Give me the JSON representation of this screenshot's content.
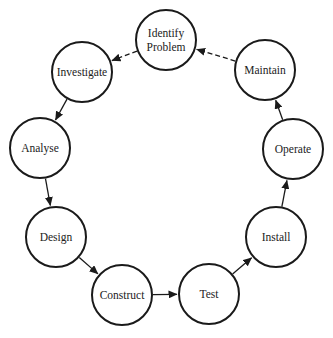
{
  "diagram": {
    "type": "cycle",
    "nodes": [
      {
        "id": "identify",
        "label_lines": [
          "Identify",
          "Problem"
        ],
        "cx": 166,
        "cy": 40,
        "r": 30
      },
      {
        "id": "investigate",
        "label_lines": [
          "Investigate"
        ],
        "cx": 82,
        "cy": 72,
        "r": 30
      },
      {
        "id": "analyse",
        "label_lines": [
          "Analyse"
        ],
        "cx": 40,
        "cy": 148,
        "r": 30
      },
      {
        "id": "design",
        "label_lines": [
          "Design"
        ],
        "cx": 56,
        "cy": 237,
        "r": 30
      },
      {
        "id": "construct",
        "label_lines": [
          "Construct"
        ],
        "cx": 122,
        "cy": 295,
        "r": 30
      },
      {
        "id": "test",
        "label_lines": [
          "Test"
        ],
        "cx": 209,
        "cy": 294,
        "r": 30
      },
      {
        "id": "install",
        "label_lines": [
          "Install"
        ],
        "cx": 276,
        "cy": 237,
        "r": 30
      },
      {
        "id": "operate",
        "label_lines": [
          "Operate"
        ],
        "cx": 293,
        "cy": 149,
        "r": 30
      },
      {
        "id": "maintain",
        "label_lines": [
          "Maintain"
        ],
        "cx": 265,
        "cy": 70,
        "r": 30
      }
    ],
    "edges": [
      {
        "from": "identify",
        "to": "investigate",
        "style": "dashed"
      },
      {
        "from": "investigate",
        "to": "analyse",
        "style": "solid"
      },
      {
        "from": "analyse",
        "to": "design",
        "style": "solid"
      },
      {
        "from": "design",
        "to": "construct",
        "style": "solid"
      },
      {
        "from": "construct",
        "to": "test",
        "style": "solid"
      },
      {
        "from": "test",
        "to": "install",
        "style": "solid"
      },
      {
        "from": "install",
        "to": "operate",
        "style": "solid"
      },
      {
        "from": "operate",
        "to": "maintain",
        "style": "solid"
      },
      {
        "from": "maintain",
        "to": "identify",
        "style": "dashed"
      }
    ],
    "colors": {
      "stroke": "#1a1a1a",
      "text": "#222222",
      "background": "#ffffff"
    }
  }
}
